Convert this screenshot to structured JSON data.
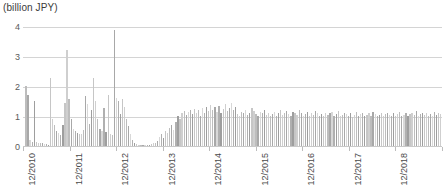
{
  "chart_data": {
    "type": "bar",
    "title": "",
    "subtitle": "",
    "unit_label": "(billion JPY)",
    "xlabel": "",
    "ylabel": "",
    "ylim": [
      0,
      4
    ],
    "yticks": [
      0,
      1,
      2,
      3,
      4
    ],
    "ytick_labels": [
      "0",
      "1",
      "2",
      "3",
      "4"
    ],
    "grid": true,
    "legend": null,
    "legend_position": "none",
    "bar_color": "#b4b4b4",
    "grid_color": "#d4d4d4",
    "x_tick_labels": [
      "12/2010",
      "12/2011",
      "12/2012",
      "12/2013",
      "12/2014",
      "12/2015",
      "12/2016",
      "12/2017",
      "12/2018",
      "12/2019"
    ],
    "x_tick_positions": [
      0,
      46.6,
      93.1,
      139.7,
      186.2,
      232.8,
      279.3,
      325.9,
      372.4,
      419.0
    ],
    "x_start": "12/2010",
    "x_end": "12/2019",
    "x_frequency": "monthly",
    "values": [
      0.05,
      2.05,
      1.75,
      0.22,
      0.18,
      1.55,
      0.16,
      0.14,
      0.12,
      0.13,
      0.1,
      0.09,
      0.08,
      2.3,
      0.95,
      0.72,
      0.55,
      0.48,
      0.4,
      0.75,
      1.48,
      3.25,
      1.6,
      0.92,
      0.6,
      0.52,
      0.48,
      0.45,
      0.42,
      0.58,
      1.7,
      1.45,
      0.78,
      1.25,
      2.3,
      1.55,
      0.95,
      0.6,
      0.55,
      1.3,
      0.5,
      1.75,
      0.45,
      0.4,
      3.9,
      1.65,
      1.55,
      1.1,
      1.6,
      1.35,
      0.95,
      0.7,
      0.45,
      0.25,
      0.15,
      0.1,
      0.08,
      0.07,
      0.06,
      0.06,
      0.07,
      0.08,
      0.1,
      0.12,
      0.14,
      0.2,
      0.35,
      0.42,
      0.3,
      0.55,
      0.48,
      0.62,
      0.75,
      0.58,
      0.82,
      1.05,
      0.95,
      1.12,
      1.2,
      1.08,
      1.18,
      1.25,
      1.1,
      1.28,
      1.15,
      1.22,
      1.05,
      1.3,
      1.12,
      1.35,
      1.2,
      1.4,
      1.25,
      1.32,
      1.18,
      1.38,
      1.15,
      1.28,
      1.42,
      1.2,
      1.3,
      1.48,
      1.22,
      1.35,
      1.1,
      1.05,
      1.18,
      1.12,
      1.25,
      1.08,
      1.15,
      1.3,
      1.2,
      1.1,
      1.05,
      1.18,
      1.12,
      1.22,
      1.08,
      1.15,
      1.02,
      1.1,
      1.18,
      1.05,
      1.12,
      1.25,
      1.08,
      1.15,
      1.2,
      1.1,
      1.05,
      1.18,
      1.12,
      1.08,
      1.22,
      1.15,
      1.05,
      1.1,
      1.18,
      1.02,
      1.12,
      1.08,
      1.2,
      1.15,
      1.05,
      1.1,
      1.02,
      1.15,
      1.08,
      1.12,
      1.18,
      1.05,
      1.1,
      1.2,
      1.02,
      1.08,
      1.15,
      1.1,
      1.05,
      1.12,
      1.0,
      1.08,
      1.18,
      1.05,
      1.1,
      1.15,
      1.02,
      1.08,
      1.12,
      1.05,
      1.18,
      1.1,
      1.02,
      1.08,
      1.15,
      1.05,
      1.1,
      1.12,
      1.08,
      1.02,
      1.15,
      1.05,
      1.1,
      1.18,
      1.02,
      1.08,
      1.12,
      1.05,
      1.1,
      1.15,
      1.08,
      1.2,
      1.05,
      1.1,
      1.12,
      1.08,
      1.15,
      1.02,
      1.1,
      1.05,
      1.18,
      1.08,
      1.12,
      1.1
    ]
  }
}
